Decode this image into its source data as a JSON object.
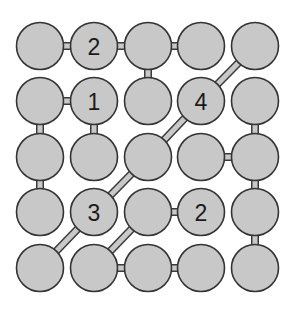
{
  "puzzle": {
    "type": "connected-circles-grid",
    "rows": 5,
    "cols": 5,
    "colors": {
      "background": "#ffffff",
      "circle_fill": "#c8c8c8",
      "circle_stroke": "#333333",
      "digit": "#1a1a1a"
    },
    "cells": [
      [
        {
          "label": ""
        },
        {
          "label": "2"
        },
        {
          "label": ""
        },
        {
          "label": ""
        },
        {
          "label": ""
        }
      ],
      [
        {
          "label": ""
        },
        {
          "label": "1"
        },
        {
          "label": ""
        },
        {
          "label": "4"
        },
        {
          "label": ""
        }
      ],
      [
        {
          "label": ""
        },
        {
          "label": ""
        },
        {
          "label": ""
        },
        {
          "label": ""
        },
        {
          "label": ""
        }
      ],
      [
        {
          "label": ""
        },
        {
          "label": "3"
        },
        {
          "label": ""
        },
        {
          "label": "2"
        },
        {
          "label": ""
        }
      ],
      [
        {
          "label": ""
        },
        {
          "label": ""
        },
        {
          "label": ""
        },
        {
          "label": ""
        },
        {
          "label": ""
        }
      ]
    ],
    "links": [
      {
        "from": [
          0,
          0
        ],
        "to": [
          0,
          1
        ]
      },
      {
        "from": [
          0,
          1
        ],
        "to": [
          0,
          2
        ]
      },
      {
        "from": [
          0,
          2
        ],
        "to": [
          0,
          3
        ]
      },
      {
        "from": [
          0,
          2
        ],
        "to": [
          1,
          2
        ]
      },
      {
        "from": [
          0,
          4
        ],
        "to": [
          1,
          3
        ]
      },
      {
        "from": [
          1,
          0
        ],
        "to": [
          1,
          1
        ]
      },
      {
        "from": [
          1,
          0
        ],
        "to": [
          2,
          0
        ]
      },
      {
        "from": [
          1,
          1
        ],
        "to": [
          2,
          1
        ]
      },
      {
        "from": [
          1,
          3
        ],
        "to": [
          2,
          2
        ]
      },
      {
        "from": [
          1,
          4
        ],
        "to": [
          2,
          4
        ]
      },
      {
        "from": [
          2,
          0
        ],
        "to": [
          3,
          0
        ]
      },
      {
        "from": [
          2,
          2
        ],
        "to": [
          3,
          1
        ]
      },
      {
        "from": [
          2,
          3
        ],
        "to": [
          2,
          4
        ]
      },
      {
        "from": [
          2,
          4
        ],
        "to": [
          3,
          4
        ]
      },
      {
        "from": [
          3,
          1
        ],
        "to": [
          4,
          0
        ]
      },
      {
        "from": [
          3,
          2
        ],
        "to": [
          3,
          3
        ]
      },
      {
        "from": [
          3,
          2
        ],
        "to": [
          4,
          1
        ]
      },
      {
        "from": [
          3,
          4
        ],
        "to": [
          4,
          4
        ]
      },
      {
        "from": [
          4,
          1
        ],
        "to": [
          4,
          2
        ]
      },
      {
        "from": [
          4,
          2
        ],
        "to": [
          4,
          3
        ]
      }
    ]
  }
}
